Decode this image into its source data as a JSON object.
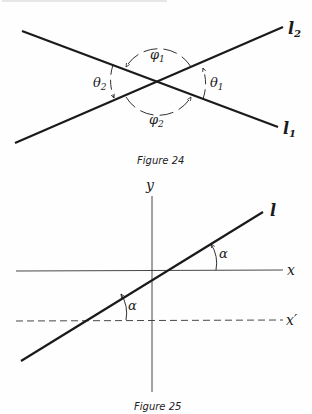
{
  "figure24": {
    "caption": "Figure 24",
    "lines": [
      {
        "name": "l1",
        "label": "l",
        "subscript": "1"
      },
      {
        "name": "l2",
        "label": "l",
        "subscript": "2"
      }
    ],
    "angles": [
      {
        "name": "phi1",
        "label": "φ",
        "subscript": "1"
      },
      {
        "name": "phi2",
        "label": "φ",
        "subscript": "2"
      },
      {
        "name": "theta1",
        "label": "θ",
        "subscript": "1"
      },
      {
        "name": "theta2",
        "label": "θ",
        "subscript": "2"
      }
    ]
  },
  "figure25": {
    "caption": "Figure 25",
    "axes": {
      "x_label": "x",
      "y_label": "y",
      "x_prime_label": "x′"
    },
    "line_label": "l",
    "angle_label_upper": "α",
    "angle_label_lower": "α"
  },
  "colors": {
    "ink": "#1a1a1a",
    "paper": "#fefefe"
  }
}
